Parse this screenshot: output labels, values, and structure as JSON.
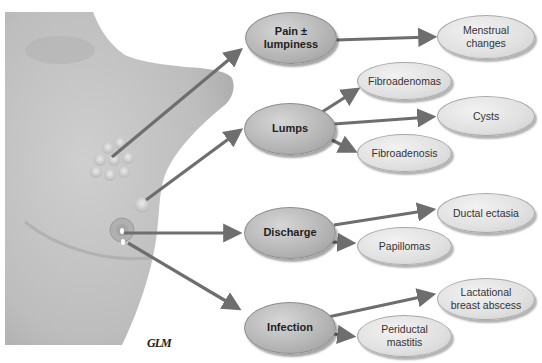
{
  "diagram": {
    "type": "flow diagram of breast symptoms to causes",
    "primary_nodes": [
      {
        "id": "pain",
        "label": "Pain ± lumpiness"
      },
      {
        "id": "lumps",
        "label": "Lumps"
      },
      {
        "id": "discharge",
        "label": "Discharge"
      },
      {
        "id": "infection",
        "label": "Infection"
      }
    ],
    "secondary_nodes": [
      {
        "id": "menstrual",
        "label": "Menstrual changes",
        "parent": "pain"
      },
      {
        "id": "fibroadenomas",
        "label": "Fibroadenomas",
        "parent": "lumps"
      },
      {
        "id": "cysts",
        "label": "Cysts",
        "parent": "lumps"
      },
      {
        "id": "fibroadenosis",
        "label": "Fibroadenosis",
        "parent": "lumps"
      },
      {
        "id": "ductal",
        "label": "Ductal ectasia",
        "parent": "discharge"
      },
      {
        "id": "papillomas",
        "label": "Papillomas",
        "parent": "discharge"
      },
      {
        "id": "abscess",
        "label": "Lactational breast abscess",
        "parent": "infection"
      },
      {
        "id": "mastitis",
        "label": "Periductal mastitis",
        "parent": "infection"
      }
    ],
    "labels": {
      "pain": "Pain ±",
      "pain2": "lumpiness",
      "lumps": "Lumps",
      "discharge": "Discharge",
      "infection": "Infection",
      "menstrual1": "Menstrual",
      "menstrual2": "changes",
      "fibroadenomas": "Fibroadenomas",
      "cysts": "Cysts",
      "fibroadenosis": "Fibroadenosis",
      "ductal": "Ductal ectasia",
      "papillomas": "Papillomas",
      "abscess1": "Lactational",
      "abscess2": "breast abscess",
      "mastitis1": "Periductal",
      "mastitis2": "mastitis"
    },
    "illustration": "breast-anatomy-illustration",
    "credit": "GLM",
    "colors": {
      "primary_fill": "#b4b4b4",
      "secondary_fill": "#e0e0e0",
      "arrow": "#6e6e6e",
      "skin": "#c4c4c4"
    }
  }
}
